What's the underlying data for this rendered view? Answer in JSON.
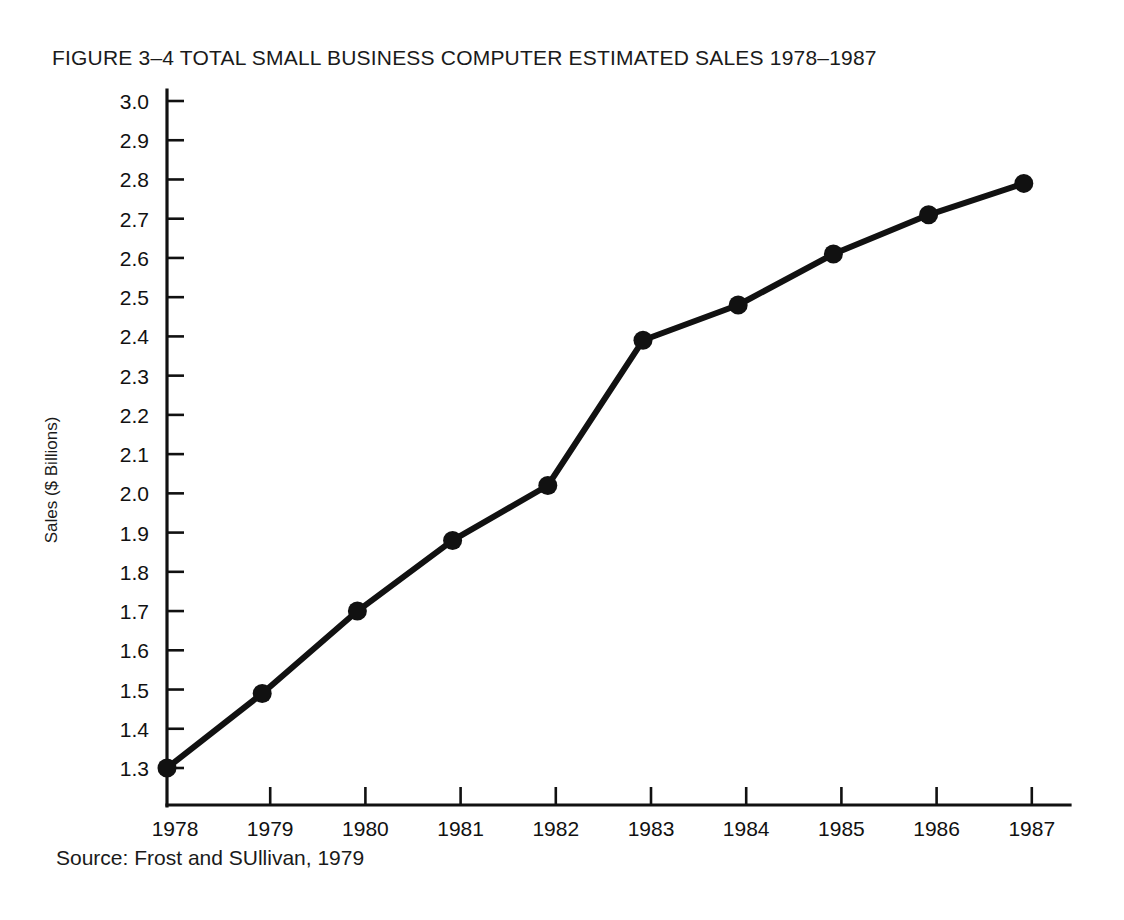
{
  "figure": {
    "title": "FIGURE 3–4 TOTAL SMALL BUSINESS COMPUTER ESTIMATED SALES 1978–1987",
    "source": "Source: Frost and SUllivan, 1979"
  },
  "chart_data": {
    "type": "line",
    "title": "FIGURE 3–4 TOTAL SMALL BUSINESS COMPUTER ESTIMATED SALES 1978–1987",
    "xlabel": "",
    "ylabel": "Sales ($ Billions)",
    "categories": [
      "1978",
      "1979",
      "1980",
      "1981",
      "1982",
      "1983",
      "1984",
      "1985",
      "1986",
      "1987"
    ],
    "values": [
      1.3,
      1.49,
      1.7,
      1.88,
      2.02,
      2.39,
      2.48,
      2.61,
      2.71,
      2.79
    ],
    "series": [
      {
        "name": "Total small business computer estimated sales",
        "values": [
          1.3,
          1.49,
          1.7,
          1.88,
          2.02,
          2.39,
          2.48,
          2.61,
          2.71,
          2.79
        ]
      }
    ],
    "ylim": [
      1.3,
      3.0
    ],
    "ytick_labels": [
      "3.0",
      "2.9",
      "2.8",
      "2.7",
      "2.6",
      "2.5",
      "2.4",
      "2.3",
      "2.2",
      "2.1",
      "2.0",
      "1.9",
      "1.8",
      "1.7",
      "1.6",
      "1.5",
      "1.4",
      "1.3"
    ],
    "ytick_values": [
      3.0,
      2.9,
      2.8,
      2.7,
      2.6,
      2.5,
      2.4,
      2.3,
      2.2,
      2.1,
      2.0,
      1.9,
      1.8,
      1.7,
      1.6,
      1.5,
      1.4,
      1.3
    ],
    "xtick_labels": [
      "1978",
      "1979",
      "1980",
      "1981",
      "1982",
      "1983",
      "1984",
      "1985",
      "1986",
      "1987"
    ],
    "grid": false,
    "legend": "none",
    "marker": "filled-circle",
    "line_color": "#111111",
    "background_color": "#ffffff"
  }
}
